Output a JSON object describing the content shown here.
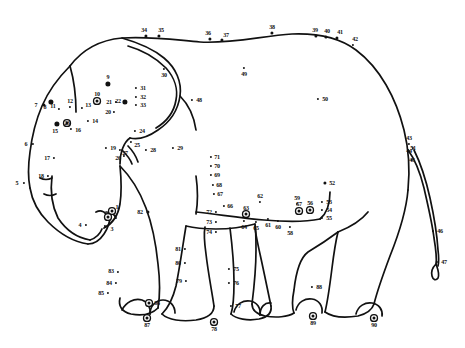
{
  "page": {
    "width": 465,
    "height": 348,
    "background_color": "#ffffff",
    "ink_color": "#111111",
    "puzzle_type": "dot-to-dot",
    "dot_count": 90,
    "number_range": "1-90"
  },
  "dots": [
    {
      "n": "1",
      "x": 112,
      "y": 211,
      "style": "ringdot",
      "label_dx": 5,
      "label_dy": -4
    },
    {
      "n": "2",
      "x": 108,
      "y": 217,
      "style": "ringdot",
      "label_dx": 7,
      "label_dy": 0
    },
    {
      "n": "3",
      "x": 105,
      "y": 226,
      "style": "sm",
      "label_dx": 7,
      "label_dy": 3
    },
    {
      "n": "4",
      "x": 86,
      "y": 225,
      "style": "sm",
      "label_dx": -6,
      "label_dy": 0
    },
    {
      "n": "5",
      "x": 24,
      "y": 183,
      "style": "sm",
      "label_dx": -7,
      "label_dy": 0
    },
    {
      "n": "6",
      "x": 33,
      "y": 144,
      "style": "sm",
      "label_dx": -7,
      "label_dy": 0
    },
    {
      "n": "7",
      "x": 44,
      "y": 105,
      "style": "md",
      "label_dx": -8,
      "label_dy": 0
    },
    {
      "n": "8",
      "x": 51,
      "y": 102,
      "style": "lg",
      "label_dx": -6,
      "label_dy": 5
    },
    {
      "n": "9",
      "x": 108,
      "y": 84,
      "style": "lg",
      "label_dx": 0,
      "label_dy": -7
    },
    {
      "n": "10",
      "x": 97,
      "y": 101,
      "style": "ringdot",
      "label_dx": 0,
      "label_dy": -7
    },
    {
      "n": "11",
      "x": 59,
      "y": 109,
      "style": "sm",
      "label_dx": -6,
      "label_dy": -3
    },
    {
      "n": "12",
      "x": 70,
      "y": 107,
      "style": "sm",
      "label_dx": 0,
      "label_dy": -6
    },
    {
      "n": "13",
      "x": 82,
      "y": 108,
      "style": "sm",
      "label_dx": 6,
      "label_dy": -3
    },
    {
      "n": "14",
      "x": 88,
      "y": 121,
      "style": "sm",
      "label_dx": 7,
      "label_dy": 0
    },
    {
      "n": "15",
      "x": 57,
      "y": 124,
      "style": "lg",
      "label_dx": -2,
      "label_dy": 7
    },
    {
      "n": "16",
      "x": 71,
      "y": 129,
      "style": "sm",
      "label_dx": 7,
      "label_dy": 1
    },
    {
      "n": "17",
      "x": 54,
      "y": 158,
      "style": "sm",
      "label_dx": -7,
      "label_dy": 0
    },
    {
      "n": "18",
      "x": 48,
      "y": 176,
      "style": "sm",
      "label_dx": -7,
      "label_dy": 0
    },
    {
      "n": "19",
      "x": 106,
      "y": 148,
      "style": "sm",
      "label_dx": 7,
      "label_dy": 0
    },
    {
      "n": "20",
      "x": 114,
      "y": 112,
      "style": "sm",
      "label_dx": -6,
      "label_dy": 0
    },
    {
      "n": "21",
      "x": 116,
      "y": 102,
      "style": "sm",
      "label_dx": -7,
      "label_dy": 0
    },
    {
      "n": "22",
      "x": 125,
      "y": 102,
      "style": "lg",
      "label_dx": -7,
      "label_dy": -1
    },
    {
      "n": "23",
      "x": 67,
      "y": 123,
      "style": "ringdot",
      "label_dx": 0,
      "label_dy": 0
    },
    {
      "n": "24",
      "x": 135,
      "y": 131,
      "style": "sm",
      "label_dx": 7,
      "label_dy": 0
    },
    {
      "n": "25",
      "x": 131,
      "y": 142,
      "style": "sm",
      "label_dx": 6,
      "label_dy": 3
    },
    {
      "n": "26",
      "x": 124,
      "y": 156,
      "style": "sm",
      "label_dx": -6,
      "label_dy": 2
    },
    {
      "n": "27",
      "x": 120,
      "y": 150,
      "style": "sm",
      "label_dx": 5,
      "label_dy": 3
    },
    {
      "n": "28",
      "x": 146,
      "y": 150,
      "style": "sm",
      "label_dx": 7,
      "label_dy": 0
    },
    {
      "n": "29",
      "x": 173,
      "y": 148,
      "style": "sm",
      "label_dx": 7,
      "label_dy": 0
    },
    {
      "n": "30",
      "x": 164,
      "y": 69,
      "style": "sm",
      "label_dx": 0,
      "label_dy": 6
    },
    {
      "n": "31",
      "x": 136,
      "y": 88,
      "style": "sm",
      "label_dx": 7,
      "label_dy": 0
    },
    {
      "n": "32",
      "x": 136,
      "y": 97,
      "style": "sm",
      "label_dx": 7,
      "label_dy": 0
    },
    {
      "n": "33",
      "x": 136,
      "y": 105,
      "style": "sm",
      "label_dx": 7,
      "label_dy": 0
    },
    {
      "n": "34",
      "x": 146,
      "y": 36,
      "style": "md",
      "label_dx": -2,
      "label_dy": -6
    },
    {
      "n": "35",
      "x": 159,
      "y": 36,
      "style": "md",
      "label_dx": 2,
      "label_dy": -6
    },
    {
      "n": "36",
      "x": 210,
      "y": 39,
      "style": "md",
      "label_dx": -2,
      "label_dy": -6
    },
    {
      "n": "37",
      "x": 222,
      "y": 40,
      "style": "md",
      "label_dx": 4,
      "label_dy": -5
    },
    {
      "n": "38",
      "x": 272,
      "y": 33,
      "style": "md",
      "label_dx": 0,
      "label_dy": -6
    },
    {
      "n": "39",
      "x": 316,
      "y": 36,
      "style": "md",
      "label_dx": -1,
      "label_dy": -6
    },
    {
      "n": "40",
      "x": 326,
      "y": 37,
      "style": "md",
      "label_dx": 1,
      "label_dy": -6
    },
    {
      "n": "41",
      "x": 337,
      "y": 38,
      "style": "md",
      "label_dx": 3,
      "label_dy": -6
    },
    {
      "n": "42",
      "x": 353,
      "y": 45,
      "style": "sm",
      "label_dx": 2,
      "label_dy": -6
    },
    {
      "n": "43",
      "x": 409,
      "y": 144,
      "style": "sm",
      "label_dx": 0,
      "label_dy": -6
    },
    {
      "n": "44",
      "x": 409,
      "y": 151,
      "style": "sm",
      "label_dx": 0,
      "label_dy": 0
    },
    {
      "n": "45",
      "x": 412,
      "y": 160,
      "style": "sm",
      "label_dx": 0,
      "label_dy": 0
    },
    {
      "n": "46",
      "x": 433,
      "y": 231,
      "style": "sm",
      "label_dx": 7,
      "label_dy": 0
    },
    {
      "n": "47",
      "x": 437,
      "y": 262,
      "style": "sm",
      "label_dx": 7,
      "label_dy": 0
    },
    {
      "n": "48",
      "x": 192,
      "y": 100,
      "style": "sm",
      "label_dx": 7,
      "label_dy": 0
    },
    {
      "n": "49",
      "x": 244,
      "y": 68,
      "style": "sm",
      "label_dx": 0,
      "label_dy": 6
    },
    {
      "n": "50",
      "x": 318,
      "y": 99,
      "style": "sm",
      "label_dx": 7,
      "label_dy": 0
    },
    {
      "n": "51",
      "x": 413,
      "y": 148,
      "style": "sm",
      "label_dx": 0,
      "label_dy": 0
    },
    {
      "n": "52",
      "x": 325,
      "y": 183,
      "style": "md",
      "label_dx": 7,
      "label_dy": 0
    },
    {
      "n": "53",
      "x": 322,
      "y": 202,
      "style": "sm",
      "label_dx": 7,
      "label_dy": 0
    },
    {
      "n": "54",
      "x": 322,
      "y": 210,
      "style": "sm",
      "label_dx": 7,
      "label_dy": 0
    },
    {
      "n": "55",
      "x": 322,
      "y": 218,
      "style": "sm",
      "label_dx": 7,
      "label_dy": 0
    },
    {
      "n": "56",
      "x": 310,
      "y": 210,
      "style": "ringdot",
      "label_dx": 0,
      "label_dy": -7
    },
    {
      "n": "57",
      "x": 299,
      "y": 211,
      "style": "ringdot",
      "label_dx": 0,
      "label_dy": -7
    },
    {
      "n": "58",
      "x": 290,
      "y": 227,
      "style": "sm",
      "label_dx": 0,
      "label_dy": 6
    },
    {
      "n": "59",
      "x": 297,
      "y": 204,
      "style": "sm",
      "label_dx": 0,
      "label_dy": -6
    },
    {
      "n": "60",
      "x": 278,
      "y": 221,
      "style": "sm",
      "label_dx": 0,
      "label_dy": 6
    },
    {
      "n": "61",
      "x": 268,
      "y": 219,
      "style": "sm",
      "label_dx": 0,
      "label_dy": 6
    },
    {
      "n": "62",
      "x": 260,
      "y": 202,
      "style": "sm",
      "label_dx": 0,
      "label_dy": -6
    },
    {
      "n": "63",
      "x": 246,
      "y": 214,
      "style": "ringdot",
      "label_dx": 0,
      "label_dy": -6
    },
    {
      "n": "64",
      "x": 244,
      "y": 221,
      "style": "sm",
      "label_dx": 0,
      "label_dy": 6
    },
    {
      "n": "65",
      "x": 256,
      "y": 222,
      "style": "sm",
      "label_dx": 0,
      "label_dy": 6
    },
    {
      "n": "66",
      "x": 224,
      "y": 206,
      "style": "sm",
      "label_dx": 6,
      "label_dy": 0
    },
    {
      "n": "67",
      "x": 214,
      "y": 194,
      "style": "sm",
      "label_dx": 6,
      "label_dy": 0
    },
    {
      "n": "68",
      "x": 213,
      "y": 185,
      "style": "sm",
      "label_dx": 6,
      "label_dy": 0
    },
    {
      "n": "69",
      "x": 211,
      "y": 175,
      "style": "sm",
      "label_dx": 6,
      "label_dy": 0
    },
    {
      "n": "70",
      "x": 211,
      "y": 166,
      "style": "sm",
      "label_dx": 6,
      "label_dy": 0
    },
    {
      "n": "71",
      "x": 211,
      "y": 157,
      "style": "sm",
      "label_dx": 6,
      "label_dy": 0
    },
    {
      "n": "72",
      "x": 216,
      "y": 212,
      "style": "sm",
      "label_dx": -7,
      "label_dy": 0
    },
    {
      "n": "73",
      "x": 216,
      "y": 222,
      "style": "sm",
      "label_dx": -7,
      "label_dy": 0
    },
    {
      "n": "74",
      "x": 216,
      "y": 232,
      "style": "sm",
      "label_dx": -7,
      "label_dy": 0
    },
    {
      "n": "75",
      "x": 229,
      "y": 269,
      "style": "sm",
      "label_dx": 7,
      "label_dy": 0
    },
    {
      "n": "76",
      "x": 229,
      "y": 283,
      "style": "sm",
      "label_dx": 7,
      "label_dy": 0
    },
    {
      "n": "77",
      "x": 231,
      "y": 306,
      "style": "sm",
      "label_dx": 7,
      "label_dy": 0
    },
    {
      "n": "78",
      "x": 214,
      "y": 322,
      "style": "ringdot",
      "label_dx": 0,
      "label_dy": 7
    },
    {
      "n": "79",
      "x": 186,
      "y": 281,
      "style": "sm",
      "label_dx": -7,
      "label_dy": 0
    },
    {
      "n": "80",
      "x": 185,
      "y": 263,
      "style": "sm",
      "label_dx": -7,
      "label_dy": 0
    },
    {
      "n": "81",
      "x": 185,
      "y": 249,
      "style": "sm",
      "label_dx": -7,
      "label_dy": 0
    },
    {
      "n": "82",
      "x": 148,
      "y": 212,
      "style": "md",
      "label_dx": -8,
      "label_dy": 0
    },
    {
      "n": "83",
      "x": 118,
      "y": 272,
      "style": "sm",
      "label_dx": -7,
      "label_dy": -1
    },
    {
      "n": "84",
      "x": 116,
      "y": 283,
      "style": "sm",
      "label_dx": -7,
      "label_dy": 0
    },
    {
      "n": "85",
      "x": 108,
      "y": 293,
      "style": "sm",
      "label_dx": -7,
      "label_dy": 0
    },
    {
      "n": "86",
      "x": 149,
      "y": 303,
      "style": "ringdot",
      "label_dx": 8,
      "label_dy": 0
    },
    {
      "n": "87",
      "x": 147,
      "y": 318,
      "style": "ringdot",
      "label_dx": 0,
      "label_dy": 7
    },
    {
      "n": "88",
      "x": 312,
      "y": 287,
      "style": "sm",
      "label_dx": 7,
      "label_dy": 0
    },
    {
      "n": "89",
      "x": 313,
      "y": 316,
      "style": "ringdot",
      "label_dx": 0,
      "label_dy": 7
    },
    {
      "n": "90",
      "x": 374,
      "y": 318,
      "style": "ringdot",
      "label_dx": 0,
      "label_dy": 7
    }
  ]
}
